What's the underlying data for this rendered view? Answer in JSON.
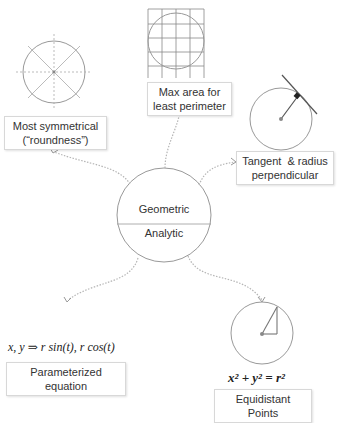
{
  "center": {
    "top_label": "Geometric",
    "bottom_label": "Analytic"
  },
  "nodes": [
    {
      "id": "symmetry",
      "label_line1": "Most symmetrical",
      "label_line2": "(“roundness”)"
    },
    {
      "id": "max-area",
      "label_line1": "Max area for",
      "label_line2": "least perimeter"
    },
    {
      "id": "tangent",
      "label_line1": "Tangent  & radius",
      "label_line2": "perpendicular"
    },
    {
      "id": "parametric",
      "label_line1": "Parameterized equation",
      "formula": "x, y ⇒ r sin(t), r cos(t)"
    },
    {
      "id": "equidistant",
      "label_line1": "Equidistant Points",
      "formula": "x² + y² = r²"
    }
  ],
  "colors": {
    "stroke": "#999999",
    "connector": "#b0b0b0",
    "label_border": "#d8d8d8",
    "text": "#333333"
  }
}
